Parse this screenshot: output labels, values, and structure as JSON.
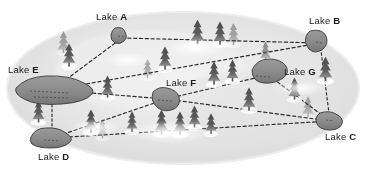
{
  "diagram": {
    "type": "node-link map over forested terrain",
    "background_color": "#ffffff",
    "terrain_color": "#e6e6e6",
    "lake_fill_color": "#8d8d8d",
    "lake_stroke_color": "#3a3a3a",
    "tree_color": "#565656",
    "edge_color": "#2a2a2a",
    "label_color": "#1b1b1b"
  },
  "lakes": [
    {
      "id": "A",
      "word": "Lake",
      "letter": "A",
      "label": "Lake A",
      "label_x": 96,
      "label_y": 12,
      "node_x": 122,
      "node_y": 38
    },
    {
      "id": "B",
      "word": "Lake",
      "letter": "B",
      "label": "Lake B",
      "label_x": 309,
      "label_y": 16,
      "node_x": 320,
      "node_y": 43
    },
    {
      "id": "C",
      "word": "Lake",
      "letter": "C",
      "label": "Lake C",
      "label_x": 325,
      "label_y": 132,
      "node_x": 330,
      "node_y": 121
    },
    {
      "id": "D",
      "word": "Lake",
      "letter": "D",
      "label": "Lake D",
      "label_x": 38,
      "label_y": 152,
      "node_x": 52,
      "node_y": 138
    },
    {
      "id": "E",
      "word": "Lake",
      "letter": "E",
      "label": "Lake E",
      "label_x": 8,
      "label_y": 65,
      "node_x": 52,
      "node_y": 90
    },
    {
      "id": "F",
      "word": "Lake",
      "letter": "F",
      "label": "Lake F",
      "label_x": 166,
      "label_y": 78,
      "node_x": 166,
      "node_y": 99
    },
    {
      "id": "G",
      "word": "Lake",
      "letter": "G",
      "label": "Lake G",
      "label_x": 284,
      "label_y": 67,
      "node_x": 268,
      "node_y": 75
    }
  ],
  "edges": [
    {
      "from": "E",
      "to": "A"
    },
    {
      "from": "A",
      "to": "B"
    },
    {
      "from": "E",
      "to": "B"
    },
    {
      "from": "E",
      "to": "F"
    },
    {
      "from": "E",
      "to": "D"
    },
    {
      "from": "D",
      "to": "F"
    },
    {
      "from": "D",
      "to": "C"
    },
    {
      "from": "F",
      "to": "G"
    },
    {
      "from": "F",
      "to": "C"
    },
    {
      "from": "G",
      "to": "C"
    },
    {
      "from": "B",
      "to": "C"
    }
  ]
}
